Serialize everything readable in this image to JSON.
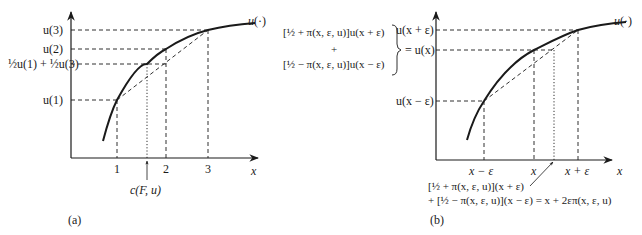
{
  "panel_a": {
    "caption": "(a)",
    "curve_label": "u(·)",
    "y_labels": {
      "u3": "u(3)",
      "u2": "u(2)",
      "mix": "½u(1) + ½u(3)",
      "u1": "u(1)"
    },
    "x_ticks": [
      "1",
      "2",
      "3"
    ],
    "x_axis_label": "x",
    "certainty_equivalent_label": "c(F, u)"
  },
  "middle_annotation": {
    "line1": "[½ + π(x, ε, u)]u(x + ε)",
    "plus": "+",
    "line3": "[½ − π(x, ε, u)]u(x − ε)"
  },
  "panel_b": {
    "caption": "(b)",
    "curve_label": "u(·)",
    "y_labels": {
      "top": "u(x + ε)",
      "mid": "= u(x)",
      "low": "u(x − ε)"
    },
    "x_ticks": [
      "x − ε",
      "x",
      "x + ε"
    ],
    "x_axis_label": "x",
    "bottom_formula_line1": "[½ + π(x, ε, u)](x + ε)",
    "bottom_formula_line2": "+ [½ − π(x, ε, u)](x − ε) = x + 2επ(x, ε, u)"
  }
}
